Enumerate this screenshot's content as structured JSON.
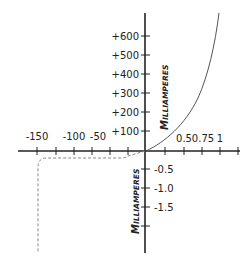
{
  "diagram": {
    "x_axis": {
      "negative_ticks": [
        {
          "label": "-150",
          "x": 37
        },
        {
          "label": "-100",
          "x": 74
        },
        {
          "label": "-50",
          "x": 97
        }
      ],
      "positive_ticks": [
        {
          "label": "0.5",
          "x": 184
        },
        {
          "label": "0.75",
          "x": 202
        },
        {
          "label": "1",
          "x": 220
        }
      ]
    },
    "y_axis": {
      "positive_ticks": [
        "+600",
        "+500",
        "+400",
        "+300",
        "+200",
        "+100"
      ],
      "negative_ticks": [
        "-0.5",
        "-1.0",
        "-1.5"
      ],
      "upper_title_first": "M",
      "upper_title_rest": "ILLIAMPERES",
      "lower_title_first": "M",
      "lower_title_rest": "ILLIAMPERES"
    },
    "colors": {
      "axis": "#222222",
      "forward_curve": "#555555",
      "reverse_curve": "#888888"
    }
  }
}
